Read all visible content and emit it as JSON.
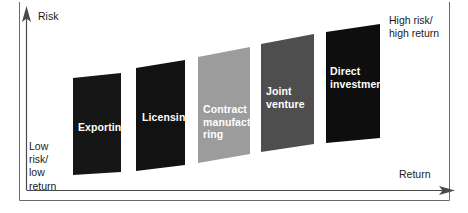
{
  "figure": {
    "width": 468,
    "height": 213,
    "background": "#ffffff",
    "frame_color": "#6b6b6b"
  },
  "axes": {
    "y": {
      "label": "Risk",
      "arrow": "up-arrow-icon",
      "color": "#4a4a4a"
    },
    "x": {
      "label": "Return",
      "arrow": "right-arrow-icon",
      "color": "#4a4a4a"
    }
  },
  "annotations": {
    "low_corner": "Low\nrisk/\nlow\nreturn",
    "high_corner": "High risk/\nhigh return"
  },
  "chart_data": {
    "type": "bar",
    "xlabel": "Return",
    "ylabel": "Risk",
    "grid": false,
    "legend": "none",
    "note": "Staircase of five market-entry modes ordered by increasing risk and return. Each bar is a quadrilateral whose top and bottom edges slope upward to the right.",
    "categories": [
      "Exporting",
      "Licensing",
      "Contract manufacturing",
      "Joint venture",
      "Direct investment"
    ],
    "values": [
      1,
      2,
      3,
      4,
      5
    ],
    "ylim": [
      0,
      5
    ],
    "bars": [
      {
        "label": "Exporting",
        "label_text": "Exporting",
        "color": "#161616",
        "rank": 1,
        "x_left": 73,
        "x_right": 121,
        "top_left": 78,
        "top_right": 73,
        "bottom_left": 175,
        "bottom_right": 172
      },
      {
        "label": "Licensing",
        "label_text": "Licensing",
        "color": "#121212",
        "rank": 2,
        "x_left": 136,
        "x_right": 185,
        "top_left": 68,
        "top_right": 60,
        "bottom_left": 171,
        "bottom_right": 165
      },
      {
        "label": "Contract manufacturing",
        "label_text": "Contract\nmanufactu-\nring",
        "color": "#9c9c9c",
        "rank": 3,
        "x_left": 198,
        "x_right": 250,
        "top_left": 57,
        "top_right": 47,
        "bottom_left": 163,
        "bottom_right": 154
      },
      {
        "label": "Joint venture",
        "label_text": "Joint\nventure",
        "color": "#4e4e4e",
        "rank": 4,
        "x_left": 261,
        "x_right": 314,
        "top_left": 44,
        "top_right": 34,
        "bottom_left": 152,
        "bottom_right": 144
      },
      {
        "label": "Direct investment",
        "label_text": "Direct\ninvestment",
        "color": "#0e0e0e",
        "rank": 5,
        "x_left": 326,
        "x_right": 380,
        "top_left": 32,
        "top_right": 24,
        "bottom_left": 143,
        "bottom_right": 138
      }
    ]
  }
}
